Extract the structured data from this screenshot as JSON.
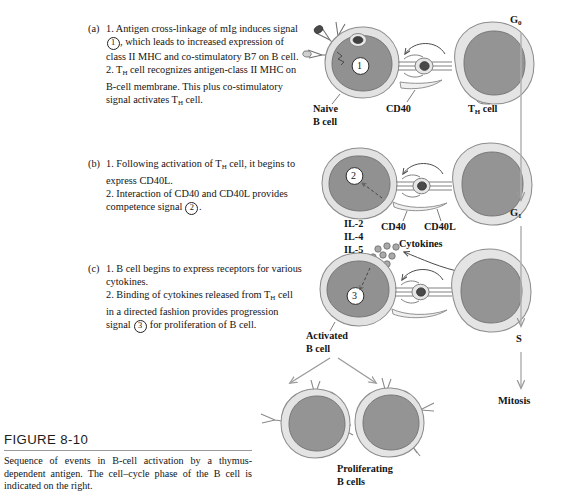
{
  "figure": {
    "number": "FIGURE 8-10",
    "caption": "Sequence of events in B-cell activation by a thymus-dependent antigen. The cell–cycle phase of the B cell is indicated on the right."
  },
  "steps": [
    {
      "label": "(a)",
      "lines": [
        "1. Antigen cross-linkage of mIg",
        "induces signal ①, which leads to",
        "increased expression of class II",
        "MHC and co-stimulatory B7 on B cell.",
        "2. Tₕ cell recognizes antigen-class II",
        "MHC on B-cell membrane. This plus",
        "co-stimulatory signal activates Tₕ cell."
      ],
      "part1_pre": "1. Antigen cross-linkage of mIg induces signal ",
      "circled": "1",
      "part1_post": ", which leads to increased expression of class II MHC and co-stimulatory B7 on B cell.",
      "part2_a": "2. T",
      "part2_sub": "H",
      "part2_b": " cell recognizes antigen-class II MHC on B-cell membrane. This plus co-stimulatory signal activates T",
      "part2_sub2": "H",
      "part2_c": " cell."
    },
    {
      "label": "(b)",
      "part1_a": "1. Following activation of T",
      "part1_sub": "H",
      "part1_b": " cell, it begins to express CD40L.",
      "part2_pre": "2. Interaction of CD40 and CD40L provides competence signal ",
      "circled": "2",
      "part2_post": "."
    },
    {
      "label": "(c)",
      "part1": "1. B cell begins to express receptors for various cytokines.",
      "part2_a": "2. Binding of cytokines released from T",
      "part2_sub": "H",
      "part2_b": " cell in a directed fashion provides progression signal ",
      "circled": "3",
      "part2_c": " for proliferation of B cell."
    }
  ],
  "diagram_labels": {
    "naive_b_cell_line1": "Naive",
    "naive_b_cell_line2": "B cell",
    "cd40_row_a": "CD40",
    "th_cell_a_pre": "T",
    "th_cell_a_sub": "H",
    "th_cell_a_post": " cell",
    "cd40_row_b": "CD40",
    "cd40l_row_b": "CD40L",
    "il2": "IL-2",
    "il4": "IL-4",
    "il5": "IL-5",
    "cytokines": "Cytokines",
    "activated_b_cell_line1": "Activated",
    "activated_b_cell_line2": "B cell",
    "proliferating_line1": "Proliferating",
    "proliferating_line2": "B cells"
  },
  "cell_cycle": {
    "phases": [
      {
        "name_pre": "G",
        "name_sub": "0",
        "name_post": ""
      },
      {
        "name_pre": "G",
        "name_sub": "1",
        "name_post": ""
      },
      {
        "name_pre": "S",
        "name_sub": "",
        "name_post": ""
      },
      {
        "name_pre": "Mitosis",
        "name_sub": "",
        "name_post": ""
      }
    ],
    "g0": "G",
    "g0_sub": "0",
    "g1": "G",
    "g1_sub": "1",
    "s": "S",
    "mitosis": "Mitosis"
  },
  "signal_numbers": {
    "row_a": "1",
    "row_b": "2",
    "row_c": "3"
  },
  "colors": {
    "nucleus": "#8e8e8e",
    "cytoplasm": "#dedede",
    "outline": "#6e6e6e",
    "antigen": "#4a4a4a",
    "arrow": "#9a9a9a",
    "text": "#141414"
  }
}
